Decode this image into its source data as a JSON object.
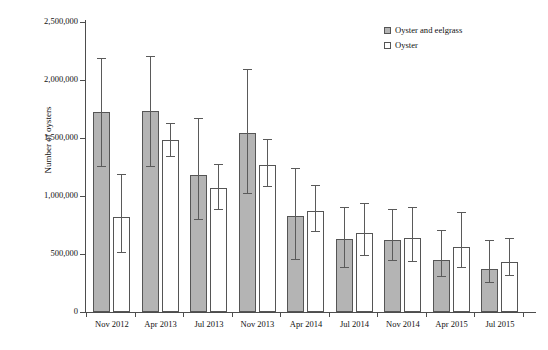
{
  "chart_data": {
    "type": "bar",
    "title": "",
    "xlabel": "",
    "ylabel": "Number of oysters",
    "ylim": [
      0,
      2500000
    ],
    "yticks": [
      0,
      500000,
      1000000,
      1500000,
      2000000,
      2500000
    ],
    "ytick_labels": [
      "0",
      "500,000",
      "1,000,000",
      "1,500,000",
      "2,000,000",
      "2,500,000"
    ],
    "grid": false,
    "legend_position": "top-right",
    "categories": [
      "Nov 2012",
      "Apr 2013",
      "Jul 2013",
      "Nov 2013",
      "Apr 2014",
      "Jul 2014",
      "Nov 2014",
      "Apr 2015",
      "Jul 2015"
    ],
    "series": [
      {
        "name": "Oyster and eelgrass",
        "style": "filled-gray",
        "color": "#b4b4b4",
        "values": [
          1720000,
          1730000,
          1180000,
          1540000,
          830000,
          630000,
          620000,
          450000,
          375000
        ],
        "error_low": [
          1250000,
          1250000,
          790000,
          1020000,
          450000,
          380000,
          440000,
          300000,
          250000
        ],
        "error_high": [
          2180000,
          2200000,
          1660000,
          2090000,
          1230000,
          900000,
          880000,
          700000,
          610000
        ]
      },
      {
        "name": "Oyster",
        "style": "open-white",
        "color": "#ffffff",
        "values": [
          820000,
          1480000,
          1070000,
          1270000,
          870000,
          680000,
          640000,
          560000,
          430000
        ],
        "error_low": [
          510000,
          1340000,
          880000,
          1080000,
          690000,
          480000,
          430000,
          380000,
          310000
        ],
        "error_high": [
          1180000,
          1620000,
          1270000,
          1480000,
          1090000,
          930000,
          900000,
          850000,
          630000
        ]
      }
    ]
  },
  "legend": {
    "items": [
      {
        "label": "Oyster and eelgrass",
        "swatch": "filled"
      },
      {
        "label": "Oyster",
        "swatch": "open"
      }
    ]
  },
  "axes": {
    "y_title": "Number of oysters"
  }
}
